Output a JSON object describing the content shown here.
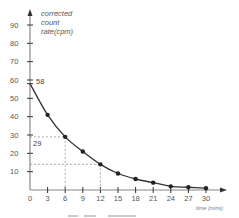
{
  "chart_data": {
    "type": "line",
    "title": "",
    "xlabel": "time (mins)",
    "ylabel": "corrected count rate(cpm)",
    "ylabel_lines": [
      "corrected",
      "count",
      "rate(cpm)"
    ],
    "x": [
      0,
      3,
      6,
      9,
      12,
      15,
      18,
      21,
      24,
      27,
      30
    ],
    "series": [
      {
        "name": "corrected count rate",
        "values": [
          58,
          41,
          29,
          21,
          14,
          9,
          6,
          4,
          2,
          1.5,
          1
        ],
        "color": "#333333",
        "markers": true
      }
    ],
    "x_ticks": [
      0,
      3,
      6,
      9,
      12,
      15,
      18,
      21,
      24,
      27,
      30
    ],
    "y_ticks": [
      10,
      20,
      30,
      40,
      50,
      60,
      70,
      80,
      90
    ],
    "xlim": [
      0,
      33
    ],
    "ylim": [
      0,
      95
    ],
    "grid": false,
    "legend": null,
    "annotations": [
      {
        "text": "58",
        "x": 0,
        "y": 58,
        "note": "initial count rate"
      },
      {
        "text": "29",
        "x": 0,
        "y": 29,
        "note": "half of initial, dashed guide to t=6"
      },
      {
        "text": "",
        "x": 0,
        "y": 14,
        "note": "quarter of initial, dashed guide to t=12"
      }
    ],
    "guides": [
      {
        "y": 29,
        "x": 6,
        "style": "dashed"
      },
      {
        "y": 14,
        "x": 12,
        "style": "dashed"
      }
    ]
  }
}
